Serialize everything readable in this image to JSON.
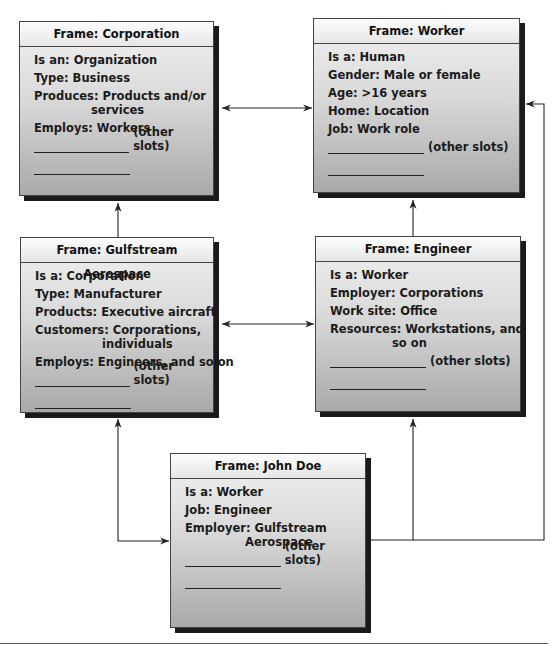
{
  "diagram": {
    "frames": {
      "corporation": {
        "title": "Frame: Corporation",
        "slots": [
          {
            "text": "Is an: Organization"
          },
          {
            "text": "Type: Business"
          },
          {
            "text": "Produces: Products and/or",
            "cont": "services"
          },
          {
            "text": "Employs: Workers"
          }
        ],
        "other_slots": "(other slots)"
      },
      "worker": {
        "title": "Frame: Worker",
        "slots": [
          {
            "text": "Is a: Human"
          },
          {
            "text": "Gender: Male or female"
          },
          {
            "text": "Age: >16 years"
          },
          {
            "text": "Home: Location"
          },
          {
            "text": "Job: Work role"
          }
        ],
        "other_slots": "(other slots)"
      },
      "gulfstream": {
        "title": "Frame: Gulfstream Aerospace",
        "slots": [
          {
            "text": "Is a: Corporation"
          },
          {
            "text": "Type: Manufacturer"
          },
          {
            "text": "Products: Executive aircraft"
          },
          {
            "text": "Customers: Corporations,",
            "cont": "individuals"
          },
          {
            "text": "Employs: Engineers, and so on"
          }
        ],
        "other_slots": "(other slots)"
      },
      "engineer": {
        "title": "Frame: Engineer",
        "slots": [
          {
            "text": "Is a: Worker"
          },
          {
            "text": "Employer: Corporations"
          },
          {
            "text": "Work site: Office"
          },
          {
            "text": "Resources: Workstations, and",
            "cont": "so on"
          }
        ],
        "other_slots": "(other slots)"
      },
      "john_doe": {
        "title": "Frame: John Doe",
        "slots": [
          {
            "text": "Is a: Worker"
          },
          {
            "text": "Job: Engineer"
          },
          {
            "text": "Employer: Gulfstream",
            "cont": "Aerospace"
          }
        ],
        "other_slots": "(other slots)"
      }
    },
    "connections": [
      {
        "from": "corporation",
        "to": "worker",
        "type": "bidirectional"
      },
      {
        "from": "gulfstream",
        "to": "engineer",
        "type": "bidirectional"
      },
      {
        "from": "gulfstream",
        "to": "corporation",
        "type": "arrow"
      },
      {
        "from": "engineer",
        "to": "worker",
        "type": "arrow"
      },
      {
        "from": "gulfstream",
        "to": "john_doe",
        "type": "bidirectional"
      },
      {
        "from": "john_doe",
        "to": "engineer",
        "type": "arrow"
      },
      {
        "from": "john_doe",
        "to": "worker",
        "type": "arrow"
      }
    ],
    "colors": {
      "line": "#222222",
      "shadow": "#1a1a1a",
      "box_top": "#f2f2f2",
      "box_bottom": "#a9a9a9"
    }
  }
}
